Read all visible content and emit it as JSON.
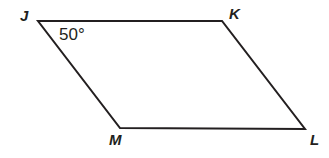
{
  "figure": {
    "kind": "parallelogram",
    "name": "parallelogram-JKLM",
    "background_color": "#ffffff",
    "stroke_color": "#231f20",
    "stroke_width": 2,
    "text_color": "#231f20",
    "width": 329,
    "height": 158
  },
  "vertices": [
    {
      "label": "J",
      "x": 38,
      "y": 21,
      "label_x": 20,
      "label_y": 8
    },
    {
      "label": "K",
      "x": 222,
      "y": 21,
      "label_x": 229,
      "label_y": 6
    },
    {
      "label": "L",
      "x": 305,
      "y": 129,
      "label_x": 310,
      "label_y": 132
    },
    {
      "label": "M",
      "x": 120,
      "y": 128,
      "label_x": 109,
      "label_y": 132
    }
  ],
  "edges": [
    {
      "name": "edge-JK",
      "from": "J",
      "to": "K"
    },
    {
      "name": "edge-KL",
      "from": "K",
      "to": "L"
    },
    {
      "name": "edge-LM",
      "from": "L",
      "to": "M"
    },
    {
      "name": "edge-MJ",
      "from": "M",
      "to": "J"
    }
  ],
  "angles": [
    {
      "name": "angle-J",
      "at_vertex": "J",
      "value": "50°",
      "label_x": 59,
      "label_y": 26
    }
  ],
  "polygon_points": "38,21 222,21 305,129 120,128"
}
